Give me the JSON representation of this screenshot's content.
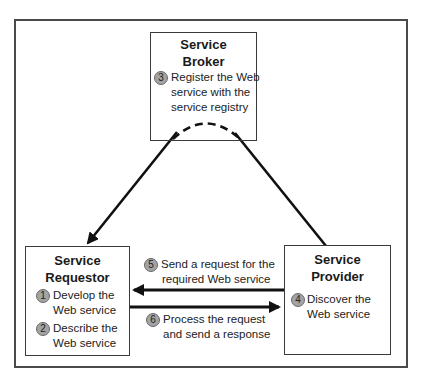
{
  "diagram": {
    "type": "web-service-architecture",
    "colors": {
      "border": "#4a4a4a",
      "line": "#111111",
      "badge_fill": "#a3a3a3",
      "badge_stroke": "#6a6a6a",
      "text": "#1a1a1a"
    },
    "broker": {
      "title_line1": "Service",
      "title_line2": "Broker",
      "step": {
        "number": "3",
        "lines": [
          "Register the Web",
          "service with the",
          "service registry"
        ]
      }
    },
    "requestor": {
      "title_line1": "Service",
      "title_line2": "Requestor",
      "steps": [
        {
          "number": "1",
          "lines": [
            "Develop the",
            "Web service"
          ]
        },
        {
          "number": "2",
          "lines": [
            "Describe the",
            "Web service"
          ]
        }
      ]
    },
    "provider": {
      "title_line1": "Service",
      "title_line2": "Provider",
      "step": {
        "number": "4",
        "lines": [
          "Discover the",
          "Web service"
        ]
      }
    },
    "messages": [
      {
        "number": "5",
        "lines": [
          "Send a request for the",
          "required Web service"
        ],
        "direction": "provider-to-requestor"
      },
      {
        "number": "6",
        "lines": [
          "Process the request",
          "and send a response"
        ],
        "direction": "requestor-to-provider"
      }
    ],
    "connections": [
      {
        "from": "broker",
        "to": "requestor",
        "style": "solid",
        "arrowhead": true
      },
      {
        "from": "broker",
        "to": "provider",
        "style": "solid",
        "arrowhead": false
      },
      {
        "from": "broker",
        "to": "broker",
        "style": "dashed-arc",
        "arrowhead": false
      }
    ]
  }
}
